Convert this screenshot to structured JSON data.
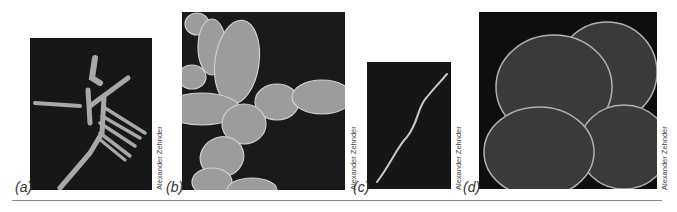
{
  "figure": {
    "panels": [
      {
        "id": "a",
        "label": "(a)",
        "credit": "Alexander Zehnder",
        "description": "Filamentous rod-shaped bacterial cells, SEM"
      },
      {
        "id": "b",
        "label": "(b)",
        "credit": "Alexander Zehnder",
        "description": "Chains of oval/rod-shaped cells, SEM"
      },
      {
        "id": "c",
        "label": "(c)",
        "credit": "Alexander Zehnder",
        "description": "Single long thin wavy filament, SEM"
      },
      {
        "id": "d",
        "label": "(d)",
        "credit": "Alexander Zehnder",
        "description": "Cluster of large coccoid cells (sarcina-like), SEM"
      }
    ],
    "colors": {
      "background": "#ffffff",
      "panel": "#151515",
      "cell": "#b5b5b5",
      "rule": "#8a8a8a"
    }
  }
}
